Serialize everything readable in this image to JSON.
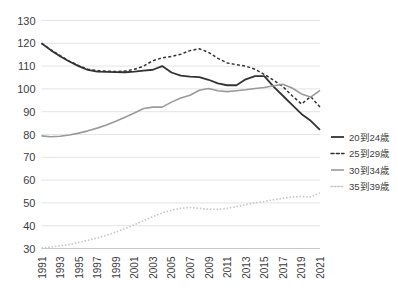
{
  "chart_data": {
    "type": "line",
    "title": "",
    "subtitle": "",
    "xlabel": "",
    "ylabel": "",
    "ylim": [
      30,
      130
    ],
    "ytick_step": 10,
    "yticks": [
      30,
      40,
      50,
      60,
      70,
      80,
      90,
      100,
      110,
      120,
      130
    ],
    "grid": true,
    "legend_position": "right",
    "x": [
      1991,
      1992,
      1993,
      1994,
      1995,
      1996,
      1997,
      1998,
      1999,
      2000,
      2001,
      2002,
      2003,
      2004,
      2005,
      2006,
      2007,
      2008,
      2009,
      2010,
      2011,
      2012,
      2013,
      2014,
      2015,
      2016,
      2017,
      2018,
      2019,
      2020,
      2021
    ],
    "xticks": [
      1991,
      1993,
      1995,
      1997,
      1999,
      2001,
      2003,
      2005,
      2007,
      2009,
      2011,
      2013,
      2015,
      2017,
      2019,
      2021
    ],
    "xtick_labels": [
      "1991",
      "1993",
      "1995",
      "1997",
      "1999",
      "2001",
      "2003",
      "2005",
      "2007",
      "2009",
      "2011",
      "2013",
      "2015",
      "2017",
      "2019",
      "2021"
    ],
    "series": [
      {
        "name": "20到24歲",
        "color": "#333333",
        "style": "solid",
        "width": 1.8,
        "values": [
          120.0,
          117.0,
          114.3,
          112.0,
          110.0,
          108.3,
          107.6,
          107.5,
          107.4,
          107.3,
          107.6,
          108.0,
          108.4,
          110.0,
          107.2,
          105.8,
          105.4,
          105.2,
          104.0,
          102.4,
          101.6,
          101.6,
          104.2,
          105.6,
          105.6,
          101.0,
          97.0,
          93.0,
          89.0,
          86.0,
          82.0
        ]
      },
      {
        "name": "25到29歲",
        "color": "#333333",
        "style": "dashed",
        "width": 1.5,
        "values": [
          120.0,
          117.2,
          114.6,
          112.2,
          110.2,
          108.6,
          108.0,
          107.8,
          107.6,
          107.8,
          108.6,
          110.0,
          112.4,
          113.6,
          114.2,
          115.2,
          116.8,
          117.6,
          116.0,
          113.4,
          111.4,
          110.6,
          110.0,
          108.6,
          106.4,
          103.8,
          101.0,
          97.0,
          93.4,
          96.6,
          92.0
        ]
      },
      {
        "name": "30到34歲",
        "color": "#9a9a9a",
        "style": "solid",
        "width": 1.6,
        "values": [
          79.4,
          79.0,
          79.2,
          79.8,
          80.6,
          81.6,
          82.8,
          84.2,
          85.8,
          87.6,
          89.4,
          91.4,
          92.0,
          92.0,
          94.2,
          96.0,
          97.2,
          99.4,
          100.2,
          99.2,
          98.8,
          99.2,
          99.6,
          100.2,
          100.6,
          101.4,
          102.0,
          100.4,
          97.8,
          96.4,
          99.4
        ]
      },
      {
        "name": "35到39歲",
        "color": "#c6c6c6",
        "style": "dotted",
        "width": 1.6,
        "values": [
          30.2,
          30.6,
          31.2,
          31.8,
          32.6,
          33.6,
          34.6,
          35.8,
          37.2,
          38.8,
          40.4,
          42.2,
          44.0,
          45.6,
          46.8,
          47.6,
          48.0,
          47.6,
          47.2,
          47.2,
          47.6,
          48.4,
          49.2,
          50.0,
          50.6,
          51.4,
          52.0,
          52.6,
          52.8,
          52.6,
          54.4
        ]
      }
    ]
  },
  "legend": {
    "items": [
      {
        "label": "20到24歲"
      },
      {
        "label": "25到29歲"
      },
      {
        "label": "30到34歲"
      },
      {
        "label": "35到39歲"
      }
    ]
  }
}
